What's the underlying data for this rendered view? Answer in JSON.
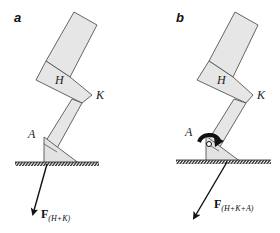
{
  "figure": {
    "panels": [
      {
        "id": "a",
        "label": "a",
        "joints": {
          "hip": "H",
          "knee": "K",
          "ankle": "A"
        },
        "force": {
          "symbol": "F",
          "subscript": "(H+K)"
        },
        "ankle_moment_shown": false
      },
      {
        "id": "b",
        "label": "b",
        "joints": {
          "hip": "H",
          "knee": "K",
          "ankle": "A"
        },
        "force": {
          "symbol": "F",
          "subscript": "(H+K+A)"
        },
        "ankle_moment_shown": true
      }
    ],
    "colors": {
      "segment_fill": "#e6e6e6",
      "segment_stroke": "#555555",
      "arrow": "#111111",
      "ground": "#222222"
    }
  }
}
